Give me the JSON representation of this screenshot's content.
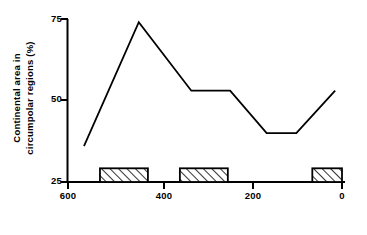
{
  "chart_data": {
    "type": "line",
    "title": "",
    "subtitle": "",
    "xlabel": "Millions of years before present",
    "ylabel": "Continental area in circumpolar regions (%)",
    "ylabel_line1": "Continental area in",
    "ylabel_line2": "circumpolar regions (%)",
    "xlim": [
      600,
      0
    ],
    "ylim": [
      25,
      75
    ],
    "x_ticks": [
      600,
      400,
      200,
      0
    ],
    "x_tick_labels": [
      "600",
      "400",
      "200",
      "0"
    ],
    "y_ticks": [
      25,
      50,
      75
    ],
    "y_tick_labels": [
      "25",
      "50",
      "75"
    ],
    "x_axis_inverted": true,
    "grid": false,
    "legend": "none",
    "series": [
      {
        "name": "Continental area in circumpolar regions",
        "line_color": "#000000",
        "line_width": 1.8,
        "x": [
          565,
          445,
          330,
          290,
          245,
          165,
          100,
          15
        ],
        "y": [
          36,
          74,
          53,
          53,
          53,
          40,
          40,
          53
        ]
      }
    ],
    "annotations": {
      "type": "hatched-bars",
      "name": "glaciation intervals",
      "fill": "diagonal-hatch",
      "edge_color": "#000000",
      "baseline": 25,
      "height": 4.2,
      "bars": [
        {
          "x_start": 530,
          "x_end": 425
        },
        {
          "x_start": 355,
          "x_end": 250
        },
        {
          "x_start": 65,
          "x_end": 0
        }
      ]
    }
  },
  "axes": {
    "y_axis_label_top": "75",
    "y_axis_label_mid": "50",
    "y_axis_label_bottom": "25",
    "x_axis_label_left": "600",
    "x_axis_label_2": "400",
    "x_axis_label_3": "200",
    "x_axis_label_right": "0"
  }
}
